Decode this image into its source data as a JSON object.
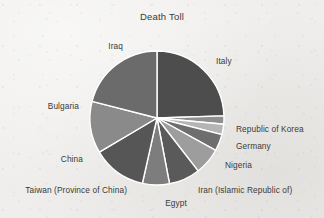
{
  "chart": {
    "title": "Death Toll"
  },
  "chart_data": {
    "type": "pie",
    "title": "Death Toll",
    "xlabel": "",
    "ylabel": "",
    "legend_position": "none",
    "grid": false,
    "labels_outside": true,
    "start_angle_deg": 0,
    "direction": "clockwise",
    "categories": [
      "Italy",
      "Republic of Korea",
      "Germany",
      "Nigeria",
      "Iran  (Islamic Republic of)",
      "Egypt",
      "Taiwan (Province of China)",
      "China",
      "Bulgaria",
      "Iraq"
    ],
    "values": [
      24.5,
      2.0,
      2.5,
      4.0,
      6.5,
      7.5,
      6.5,
      13.0,
      12.5,
      21.0
    ],
    "units": "percent",
    "slices": [
      {
        "label": "Italy",
        "value": 24.5,
        "start_deg": 0.0,
        "end_deg": 88.2,
        "color": "#4d4d4d"
      },
      {
        "label": "Republic of Korea",
        "value": 2.0,
        "start_deg": 88.2,
        "end_deg": 95.4,
        "color": "#8f8f8f"
      },
      {
        "label": "Germany",
        "value": 2.5,
        "start_deg": 95.4,
        "end_deg": 104.4,
        "color": "#b5b5b5"
      },
      {
        "label": "Nigeria",
        "value": 4.0,
        "start_deg": 104.4,
        "end_deg": 118.8,
        "color": "#6e6e6e"
      },
      {
        "label": "Iran  (Islamic Republic of)",
        "value": 6.5,
        "start_deg": 118.8,
        "end_deg": 142.2,
        "color": "#9d9d9d"
      },
      {
        "label": "Egypt",
        "value": 7.5,
        "start_deg": 142.2,
        "end_deg": 169.2,
        "color": "#5a5a5a"
      },
      {
        "label": "Taiwan (Province of China)",
        "value": 6.5,
        "start_deg": 169.2,
        "end_deg": 192.6,
        "color": "#7d7d7d"
      },
      {
        "label": "China",
        "value": 13.0,
        "start_deg": 192.6,
        "end_deg": 239.4,
        "color": "#565656"
      },
      {
        "label": "Bulgaria",
        "value": 12.5,
        "start_deg": 239.4,
        "end_deg": 284.4,
        "color": "#8a8a8a"
      },
      {
        "label": "Iraq",
        "value": 21.0,
        "start_deg": 284.4,
        "end_deg": 360.0,
        "color": "#6b6b6b"
      }
    ],
    "geometry": {
      "center_x": 157,
      "center_y": 118,
      "radius": 67,
      "separator_color": "#ffffff",
      "separator_width": 1.4
    },
    "label_positions": [
      {
        "label": "Italy",
        "x": 216,
        "y": 61,
        "align": "left"
      },
      {
        "label": "Republic of Korea",
        "x": 236,
        "y": 129,
        "align": "left"
      },
      {
        "label": "Germany",
        "x": 236,
        "y": 146,
        "align": "left"
      },
      {
        "label": "Nigeria",
        "x": 225,
        "y": 165,
        "align": "left"
      },
      {
        "label": "Iran  (Islamic Republic of)",
        "x": 198,
        "y": 190,
        "align": "left"
      },
      {
        "label": "Egypt",
        "x": 176,
        "y": 203,
        "align": "center"
      },
      {
        "label": "Taiwan (Province of China)",
        "x": 127,
        "y": 190,
        "align": "right"
      },
      {
        "label": "China",
        "x": 83,
        "y": 159,
        "align": "right"
      },
      {
        "label": "Bulgaria",
        "x": 79,
        "y": 106,
        "align": "right"
      },
      {
        "label": "Iraq",
        "x": 123,
        "y": 46,
        "align": "right"
      }
    ]
  }
}
